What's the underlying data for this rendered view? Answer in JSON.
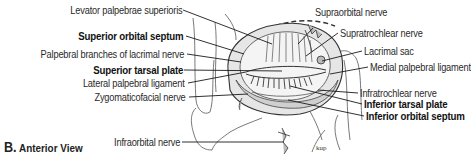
{
  "figure": {
    "view_letter": "B.",
    "view_title": "Anterior View",
    "signature": "kup"
  },
  "labels_left": [
    {
      "text": "Levator palpebrae superioris",
      "bold": false
    },
    {
      "text": "Superior orbital septum",
      "bold": true
    },
    {
      "text": "Palpebral branches of lacrimal nerve",
      "bold": false
    },
    {
      "text": "Superior tarsal plate",
      "bold": true
    },
    {
      "text": "Lateral palpebral ligament",
      "bold": false
    },
    {
      "text": "Zygomaticofacial nerve",
      "bold": false
    },
    {
      "text": "Infraorbital nerve",
      "bold": false
    }
  ],
  "labels_right": [
    {
      "text": "Supraorbital nerve",
      "bold": false
    },
    {
      "text": "Supratrochlear nerve",
      "bold": false
    },
    {
      "text": "Lacrimal sac",
      "bold": false
    },
    {
      "text": "Medial palpebral ligament",
      "bold": false
    },
    {
      "text": "Infratrochlear nerve",
      "bold": false
    },
    {
      "text": "Inferior tarsal plate",
      "bold": true
    },
    {
      "text": "Inferior orbital septum",
      "bold": true
    }
  ],
  "colors": {
    "line": "#1a1a1a",
    "sketch": "#555555",
    "shade": "#d6d6d6",
    "text": "#2a2a2a"
  }
}
